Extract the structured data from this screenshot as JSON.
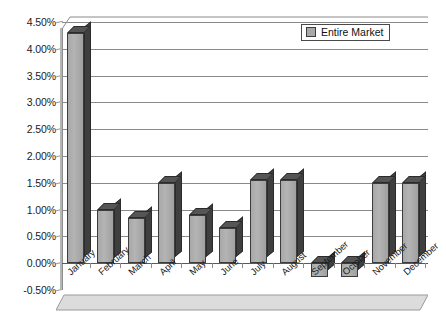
{
  "chart_data": {
    "type": "bar",
    "title": "",
    "subtitle": "",
    "xlabel": "",
    "ylabel": "",
    "categories": [
      "January",
      "February",
      "March",
      "April",
      "May",
      "June",
      "July",
      "August",
      "September",
      "October",
      "November",
      "December"
    ],
    "series": [
      {
        "name": "Entire Market",
        "values": [
          4.3,
          1.0,
          0.85,
          1.5,
          0.9,
          0.65,
          1.55,
          1.55,
          -0.25,
          -0.25,
          1.5,
          1.5
        ]
      }
    ],
    "ylim": [
      -0.5,
      4.5
    ],
    "ytick_values": [
      -0.5,
      0.0,
      0.5,
      1.0,
      1.5,
      2.0,
      2.5,
      3.0,
      3.5,
      4.0,
      4.5
    ],
    "ytick_labels": [
      "-0.50%",
      "0.00%",
      "0.50%",
      "1.00%",
      "1.50%",
      "2.00%",
      "2.50%",
      "3.00%",
      "3.50%",
      "4.00%",
      "4.50%"
    ],
    "value_format": "percent",
    "grid": true,
    "grid_axis": "y",
    "legend": {
      "position": "top-right",
      "entries": [
        {
          "label": "Entire Market",
          "color": "#a8a8a8"
        }
      ]
    },
    "style": {
      "bar_face_color": "#a8a8a8",
      "bar_edge_color": "#3c3c3c",
      "bar_side_color": "#3f3f3f",
      "bar_top_color": "#555555",
      "grid_color": "#8a8a8a",
      "axis_color": "#8d8d8d",
      "background": "#ffffff",
      "text_color": "#1a1a1a",
      "three_d": true,
      "xlabel_rotation": -42
    }
  }
}
